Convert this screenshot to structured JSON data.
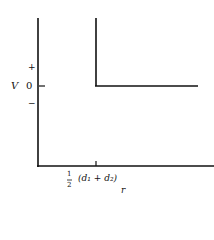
{
  "diagram": {
    "y_axis_label": "V",
    "y_tick_plus": "+",
    "y_tick_zero": "0",
    "y_tick_minus": "−",
    "x_axis_label": "r",
    "x_tick_fraction_num": "1",
    "x_tick_fraction_den": "2",
    "x_tick_expr": "(d₁ + d₂)",
    "line_color": "#111111"
  }
}
